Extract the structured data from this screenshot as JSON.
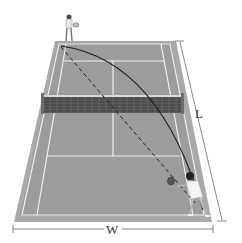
{
  "diagram": {
    "labels": {
      "length": "L",
      "width": "W"
    },
    "elements": {
      "court": "tennis court (perspective view)",
      "net": "net",
      "far_player": "server (far baseline)",
      "near_player": "receiver (near baseline)",
      "ball_path_solid": "curved trajectory",
      "ball_path_dashed": "straight-line path"
    },
    "colors": {
      "court": "#9a9a9a",
      "surround": "#a8a8a8",
      "lines": "#f2f2f2",
      "net": "#3c3c3c",
      "trajectory": "#1a1a1a",
      "dimension": "#555555"
    }
  }
}
